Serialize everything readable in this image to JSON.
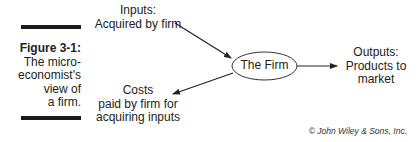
{
  "figure": {
    "number": "Figure 3-1:",
    "caption": "The micro-\neconomist's\nview of\na firm."
  },
  "diagram": {
    "center_node": "The Firm",
    "inputs_label": "Inputs:\nAcquired by firm",
    "costs_label": "Costs\npaid by firm for\nacquiring inputs",
    "outputs_label": "Outputs:\nProducts to\nmarket",
    "edges": [
      {
        "from": "Inputs: Acquired by firm",
        "to": "The Firm"
      },
      {
        "from": "The Firm",
        "to": "Costs paid by firm for acquiring inputs"
      },
      {
        "from": "The Firm",
        "to": "Outputs: Products to market"
      }
    ]
  },
  "credit": "© John Wiley & Sons, Inc.",
  "colors": {
    "ink": "#222222",
    "bar": "#1a1a1a"
  }
}
